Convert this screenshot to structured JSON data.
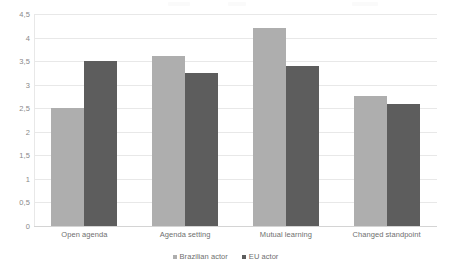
{
  "chart_data": {
    "type": "bar",
    "title": "",
    "xlabel": "",
    "ylabel": "",
    "categories": [
      "Open agenda",
      "Agenda setting",
      "Mutual learning",
      "Changed standpoint"
    ],
    "series": [
      {
        "name": "Brazilian actor",
        "color": "#aeaeae",
        "values": [
          2.5,
          3.6,
          4.2,
          2.75
        ]
      },
      {
        "name": "EU actor",
        "color": "#5d5d5d",
        "values": [
          3.5,
          3.25,
          3.4,
          2.6
        ]
      }
    ],
    "ylim": [
      0,
      4.5
    ],
    "ytick_labels": [
      "4,5",
      "4",
      "3,5",
      "3",
      "2,5",
      "2",
      "1,5",
      "1",
      "0,5",
      "0"
    ],
    "ytick_values": [
      4.5,
      4,
      3.5,
      3,
      2.5,
      2,
      1.5,
      1,
      0.5,
      0
    ],
    "grid": true,
    "legend_position": "bottom"
  }
}
